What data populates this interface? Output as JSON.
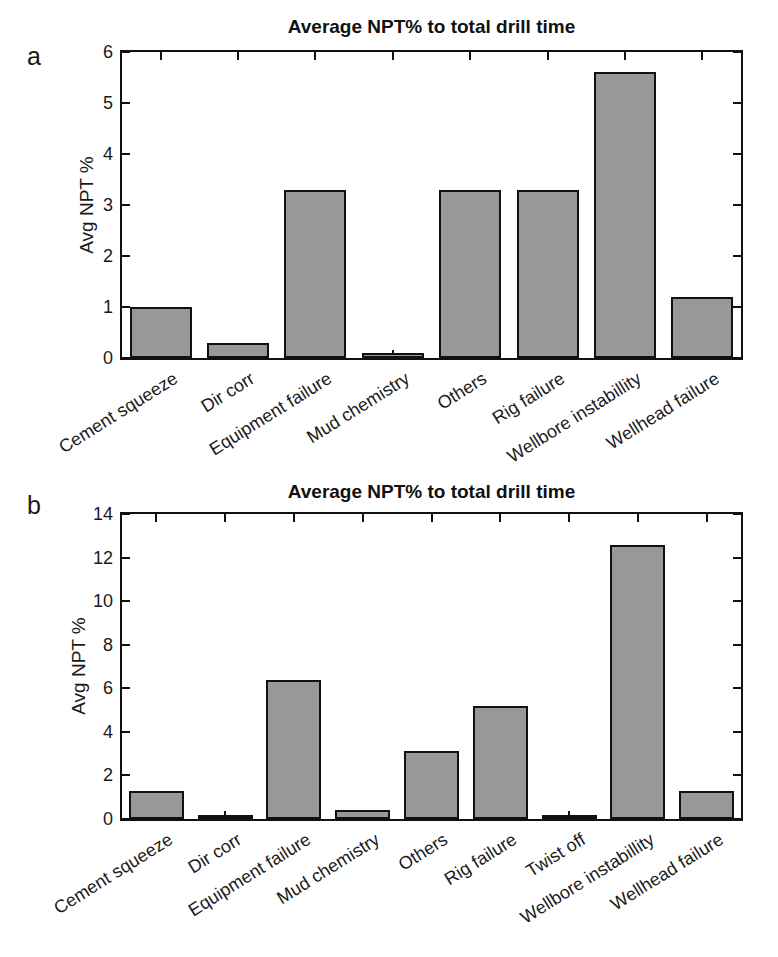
{
  "figure": {
    "background": "#ffffff",
    "text_color": "#1a1a1a",
    "axis_color": "#111111"
  },
  "chart_data": [
    {
      "type": "bar",
      "panel_letter": "a",
      "title": "Average NPT% to total drill time",
      "xlabel": "",
      "ylabel": "Avg NPT %",
      "categories": [
        "Cement squeeze",
        "Dir corr",
        "Equipment failure",
        "Mud chemistry",
        "Others",
        "Rig failure",
        "Wellbore instabillity",
        "Wellhead failure"
      ],
      "values": [
        1.0,
        0.3,
        3.3,
        0.1,
        3.3,
        3.3,
        5.6,
        1.2
      ],
      "ylim": [
        0,
        6
      ],
      "yticks": [
        0,
        1,
        2,
        3,
        4,
        5,
        6
      ],
      "grid": false,
      "legend": null,
      "bar_width_fraction": 0.8,
      "bar_color": "#989898",
      "bar_edge_color": "#111111"
    },
    {
      "type": "bar",
      "panel_letter": "b",
      "title": "Average NPT% to total drill time",
      "xlabel": "",
      "ylabel": "Avg NPT %",
      "categories": [
        "Cement squeeze",
        "Dir corr",
        "Equipment failure",
        "Mud chemistry",
        "Others",
        "Rig failure",
        "Twist off",
        "Wellbore instabillity",
        "Wellhead failure"
      ],
      "values": [
        1.3,
        0.2,
        6.4,
        0.4,
        3.1,
        5.2,
        0.2,
        12.6,
        1.3
      ],
      "ylim": [
        0,
        14
      ],
      "yticks": [
        0,
        2,
        4,
        6,
        8,
        10,
        12,
        14
      ],
      "grid": false,
      "legend": null,
      "bar_width_fraction": 0.8,
      "bar_color": "#989898",
      "bar_edge_color": "#111111"
    }
  ]
}
